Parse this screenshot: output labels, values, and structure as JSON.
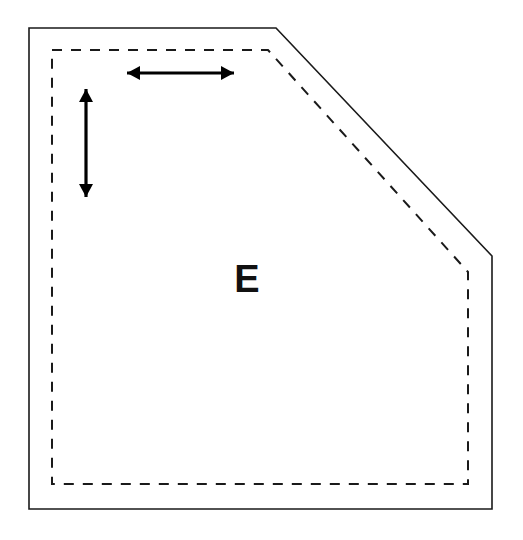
{
  "figure": {
    "background_color": "#ffffff",
    "width": 523,
    "height": 540,
    "outline": {
      "name": "room-outline",
      "style": "solid",
      "stroke_color": "#1a1a1a",
      "stroke_width": 1.6,
      "fill": "none",
      "vertices": [
        {
          "x": 29,
          "y": 28
        },
        {
          "x": 276,
          "y": 28
        },
        {
          "x": 492,
          "y": 256
        },
        {
          "x": 492,
          "y": 509
        },
        {
          "x": 29,
          "y": 509
        }
      ],
      "vertex_labels": [
        "top-left-corner",
        "chamfer-start-top",
        "chamfer-end-right",
        "bottom-right-corner",
        "bottom-left-corner"
      ]
    },
    "inner_boundary": {
      "name": "inner-dashed-boundary",
      "style": "dashed",
      "stroke_color": "#1a1a1a",
      "stroke_width": 2.0,
      "dash_pattern": "10 9",
      "fill": "none",
      "inset_px": 23,
      "vertices": [
        {
          "x": 52,
          "y": 50
        },
        {
          "x": 268,
          "y": 50
        },
        {
          "x": 468,
          "y": 272
        },
        {
          "x": 468,
          "y": 484
        },
        {
          "x": 52,
          "y": 484
        }
      ]
    },
    "annotations": {
      "width_arrow": {
        "name": "width-dimension-arrow",
        "orientation": "horizontal",
        "double_headed": true,
        "stroke_color": "#000000",
        "stroke_width": 3.2,
        "head_length": 13,
        "head_half_width": 7,
        "from": {
          "x": 127,
          "y": 73
        },
        "to": {
          "x": 234,
          "y": 73
        },
        "length_px": 107,
        "label": ""
      },
      "height_arrow": {
        "name": "height-dimension-arrow",
        "orientation": "vertical",
        "double_headed": true,
        "stroke_color": "#000000",
        "stroke_width": 3.2,
        "head_length": 13,
        "head_half_width": 7,
        "from": {
          "x": 86,
          "y": 89
        },
        "to": {
          "x": 86,
          "y": 197
        },
        "length_px": 108,
        "label": ""
      }
    },
    "labels": [
      {
        "name": "region-label-e",
        "text": "E",
        "x": 247,
        "y": 292,
        "font_size": 38,
        "font_weight": "bold",
        "color": "#111111"
      }
    ]
  }
}
